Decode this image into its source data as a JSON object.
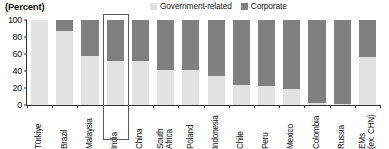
{
  "chart_data": {
    "type": "bar",
    "subtype": "stacked-percent",
    "title": "",
    "units_label": "(Percent)",
    "xlabel": "",
    "ylabel": "",
    "ylim": [
      0,
      100
    ],
    "yticks": [
      0,
      20,
      40,
      60,
      80,
      100
    ],
    "ytick_labels": [
      "0",
      "20",
      "40",
      "60",
      "80",
      "100"
    ],
    "grid": false,
    "legend_position": "top-center",
    "categories": [
      "Türkiye",
      "Brazil",
      "Malaysia",
      "India",
      "China",
      "South\nAfrica",
      "Poland",
      "Indonesia",
      "Chile",
      "Peru",
      "Mexico",
      "Colombia",
      "Russia",
      "EMs\n(ex. CHN)"
    ],
    "series": [
      {
        "name": "Government-related",
        "color": "#e2e2e2",
        "values": [
          100,
          87,
          58,
          52,
          52,
          41,
          41,
          34,
          24,
          22,
          19,
          2,
          1,
          57
        ]
      },
      {
        "name": "Corporate",
        "color": "#808080",
        "values": [
          0,
          13,
          42,
          48,
          48,
          59,
          59,
          66,
          76,
          78,
          81,
          98,
          99,
          43
        ]
      }
    ],
    "annotations": [
      {
        "type": "highlight-box",
        "target_category": "India",
        "category_index": 3
      }
    ]
  },
  "legend": {
    "entries": [
      {
        "label": "Government-related",
        "color": "#e2e2e2"
      },
      {
        "label": "Corporate",
        "color": "#808080"
      }
    ]
  }
}
